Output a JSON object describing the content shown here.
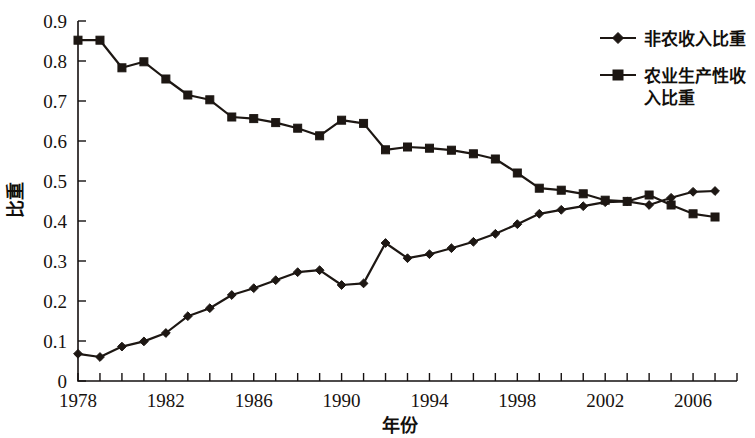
{
  "chart_data": {
    "type": "line",
    "title": "",
    "xlabel": "年份",
    "ylabel": "比重",
    "xlim": [
      1978,
      2008
    ],
    "ylim": [
      0,
      0.9
    ],
    "grid": false,
    "legend_position": "top-right",
    "x": [
      1978,
      1979,
      1980,
      1981,
      1982,
      1983,
      1984,
      1985,
      1986,
      1987,
      1988,
      1989,
      1990,
      1991,
      1992,
      1993,
      1994,
      1995,
      1996,
      1997,
      1998,
      1999,
      2000,
      2001,
      2002,
      2003,
      2004,
      2005,
      2006,
      2007
    ],
    "xtick_labels": [
      "1978",
      "1982",
      "1986",
      "1990",
      "1994",
      "1998",
      "2002",
      "2006"
    ],
    "xtick_values": [
      1978,
      1982,
      1986,
      1990,
      1994,
      1998,
      2002,
      2006
    ],
    "ytick_labels": [
      "0",
      "0.1",
      "0.2",
      "0.3",
      "0.4",
      "0.5",
      "0.6",
      "0.7",
      "0.8",
      "0.9"
    ],
    "ytick_values": [
      0,
      0.1,
      0.2,
      0.3,
      0.4,
      0.5,
      0.6,
      0.7,
      0.8,
      0.9
    ],
    "series": [
      {
        "name": "非农收入比重",
        "marker": "diamond",
        "color": "#1d1713",
        "values": [
          0.068,
          0.06,
          0.086,
          0.099,
          0.12,
          0.162,
          0.182,
          0.215,
          0.232,
          0.252,
          0.272,
          0.277,
          0.24,
          0.244,
          0.345,
          0.307,
          0.317,
          0.332,
          0.348,
          0.368,
          0.392,
          0.418,
          0.428,
          0.437,
          0.447,
          0.449,
          0.44,
          0.458,
          0.473,
          0.475
        ]
      },
      {
        "name": "农业生产性收入比重",
        "marker": "square",
        "color": "#1d1713",
        "values": [
          0.852,
          0.852,
          0.783,
          0.798,
          0.755,
          0.715,
          0.703,
          0.66,
          0.656,
          0.646,
          0.632,
          0.613,
          0.652,
          0.644,
          0.578,
          0.585,
          0.582,
          0.577,
          0.568,
          0.555,
          0.52,
          0.482,
          0.477,
          0.468,
          0.452,
          0.449,
          0.465,
          0.44,
          0.418,
          0.41
        ]
      }
    ]
  },
  "legend": {
    "entries": [
      {
        "label": "非农收入比重",
        "marker": "diamond"
      },
      {
        "label": "农业生产性收入比重",
        "marker": "square"
      }
    ],
    "line2_part1": "农业生产性收",
    "line2_part2": "入比重"
  }
}
